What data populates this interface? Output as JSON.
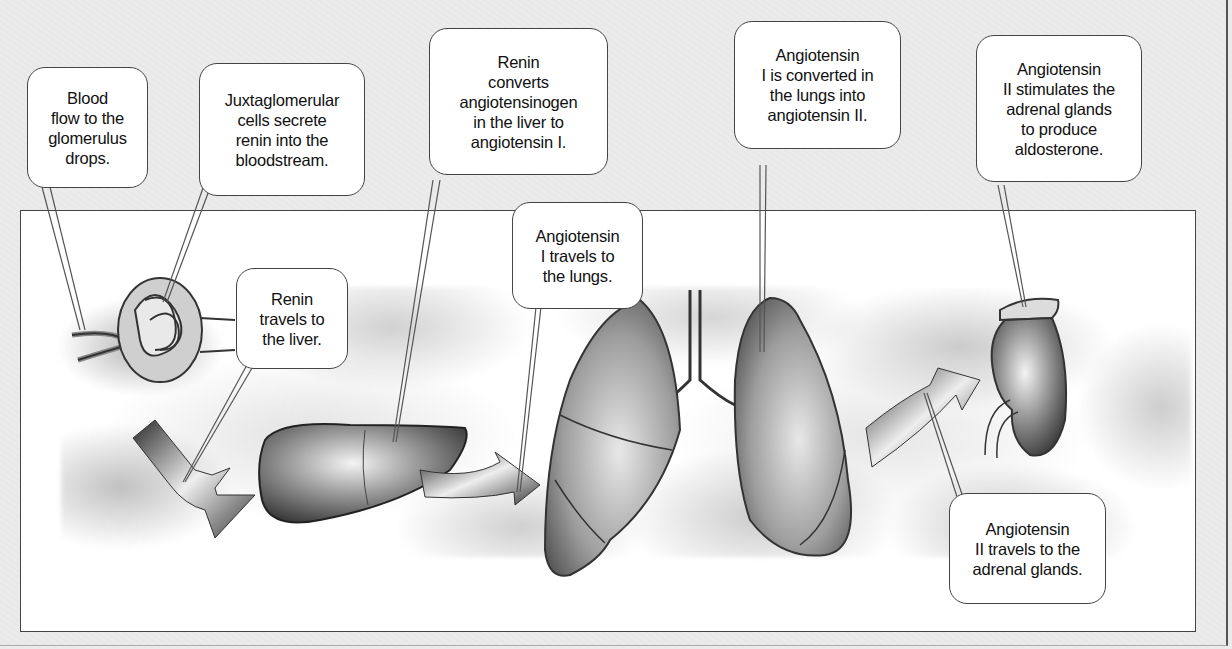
{
  "diagram": {
    "callouts": [
      {
        "id": "c1",
        "text": "Blood\nflow to the\nglomerulus\ndrops."
      },
      {
        "id": "c2",
        "text": "Juxtaglomerular\ncells secrete\nrenin into the\nbloodstream."
      },
      {
        "id": "c3",
        "text": "Renin\ntravels to\nthe liver."
      },
      {
        "id": "c4",
        "text": "Renin\nconverts\nangiotensinogen\nin the liver to\nangiotensin I."
      },
      {
        "id": "c5",
        "text": "Angiotensin\nI travels to\nthe lungs."
      },
      {
        "id": "c6",
        "text": "Angiotensin\nI is converted in\nthe lungs into\nangiotensin II."
      },
      {
        "id": "c7",
        "text": "Angiotensin\nII stimulates the\nadrenal glands\nto produce\naldosterone."
      },
      {
        "id": "c8",
        "text": "Angiotensin\nII travels to the\nadrenal glands."
      }
    ],
    "organs": [
      "glomerulus",
      "liver",
      "lungs",
      "kidney with adrenal gland"
    ],
    "colors": {
      "background": "#ebebeb",
      "panel": "#ffffff",
      "stroke": "#444444",
      "shade": "#777777"
    }
  }
}
